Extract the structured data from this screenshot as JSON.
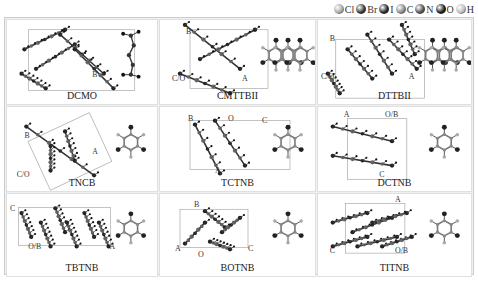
{
  "legend": {
    "items": [
      {
        "symbol": "Cl",
        "color": "#a8a8a8"
      },
      {
        "symbol": "Br",
        "color": "#3a3a3a"
      },
      {
        "symbol": "I",
        "color": "#2a2a2a"
      },
      {
        "symbol": "C",
        "color": "#8a8a8a"
      },
      {
        "symbol": "N",
        "color": "#555555"
      },
      {
        "symbol": "O",
        "color": "#1e1e1e"
      },
      {
        "symbol": "H",
        "color": "#bdbdbd"
      }
    ]
  },
  "panels": [
    {
      "name": "DCMO",
      "axes": [
        "B"
      ]
    },
    {
      "name": "CMTTBII",
      "axes": [
        "B",
        "C/O",
        "A"
      ]
    },
    {
      "name": "DTTBII",
      "axes": [
        "B",
        "C/O",
        "A"
      ]
    },
    {
      "name": "TNCB",
      "axes": [
        "B",
        "C/O",
        "A"
      ]
    },
    {
      "name": "TCTNB",
      "axes": [
        "B",
        "O",
        "C",
        "A"
      ]
    },
    {
      "name": "DCTNB",
      "axes": [
        "A",
        "O/B",
        "C"
      ]
    },
    {
      "name": "TBTNB",
      "axes": [
        "C",
        "O/B",
        "A"
      ]
    },
    {
      "name": "BOTNB",
      "axes": [
        "B",
        "A",
        "O",
        "C"
      ]
    },
    {
      "name": "TITNB",
      "axes": [
        "A",
        "C",
        "O/B"
      ]
    }
  ]
}
